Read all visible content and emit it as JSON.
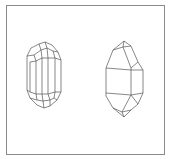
{
  "figure": {
    "frame_color": "#8a8a8a",
    "line_color": "#555555",
    "crystals": [
      {
        "name": "left-crystal",
        "type": "prismatic crystal with faceted terminations"
      },
      {
        "name": "right-crystal",
        "type": "bipyramidal prismatic crystal"
      }
    ]
  }
}
